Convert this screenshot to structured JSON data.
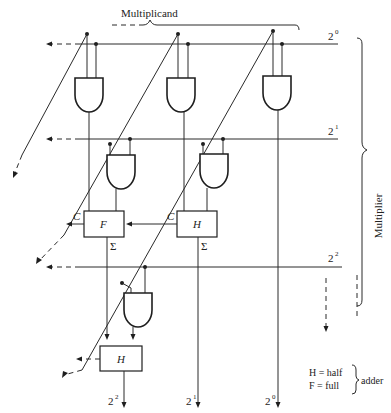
{
  "diagram": {
    "title_top": "Multiplicand",
    "title_side": "Multiplier",
    "row_labels": [
      {
        "base": "2",
        "exp": "0"
      },
      {
        "base": "2",
        "exp": "1"
      },
      {
        "base": "2",
        "exp": "2"
      }
    ],
    "output_labels": [
      {
        "base": "2",
        "exp": "2"
      },
      {
        "base": "2",
        "exp": "1"
      },
      {
        "base": "2",
        "exp": "0"
      }
    ],
    "adders": [
      {
        "id": "F",
        "label": "F",
        "type": "full",
        "carry_label": "C",
        "sum_label": "Σ"
      },
      {
        "id": "H1",
        "label": "H",
        "type": "half",
        "carry_label": "C",
        "sum_label": "Σ"
      },
      {
        "id": "H2",
        "label": "H",
        "type": "half"
      }
    ],
    "legend": {
      "h_line": "H = half",
      "f_line": "F = full",
      "suffix": "adder"
    },
    "colors": {
      "line": "#2a2a2a",
      "background": "#ffffff"
    }
  }
}
